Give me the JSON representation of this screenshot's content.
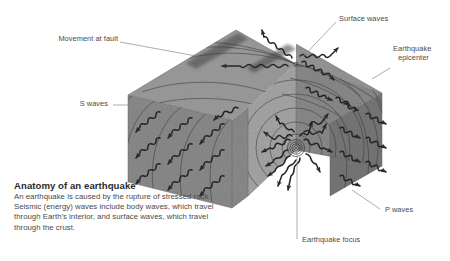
{
  "figure": {
    "title": "Anatomy of an earthquake",
    "caption": "An earthquake is caused by the rupture of stressed rock. Seismic (energy) waves include body waves, which travel through Earth's interior, and surface waves, which travel through the crust."
  },
  "labels": {
    "movement_at_fault": "Movement at fault",
    "surface_waves": "Surface waves",
    "earthquake_epicenter_line1": "Earthquake",
    "earthquake_epicenter_line2": "epicenter",
    "s_waves": "S waves",
    "p_waves": "P waves",
    "earthquake_focus": "Earthquake focus"
  },
  "colors": {
    "rock_top": "#9a9a9a",
    "rock_front": "#8e8e8e",
    "rock_side": "#7c7c7c",
    "rock_cut": "#a4a4a4",
    "fault_shadow": "#5d5d5d",
    "wave_stroke": "#2a2a2a",
    "wavefront_stroke": "#3c3c3c",
    "leader_line": "#7a7a7a",
    "text": "#4a4a4a",
    "title_text": "#2b2b2b",
    "background": "#ffffff"
  },
  "diagram_elements": {
    "focus_marker": "concentric-rings",
    "epicenter_marker": "surface-point",
    "fault_trace": "dark-band-on-top-surface",
    "body_wave_arrows": "zigzag-arrows",
    "wavefront_curves": "nested-arcs"
  }
}
